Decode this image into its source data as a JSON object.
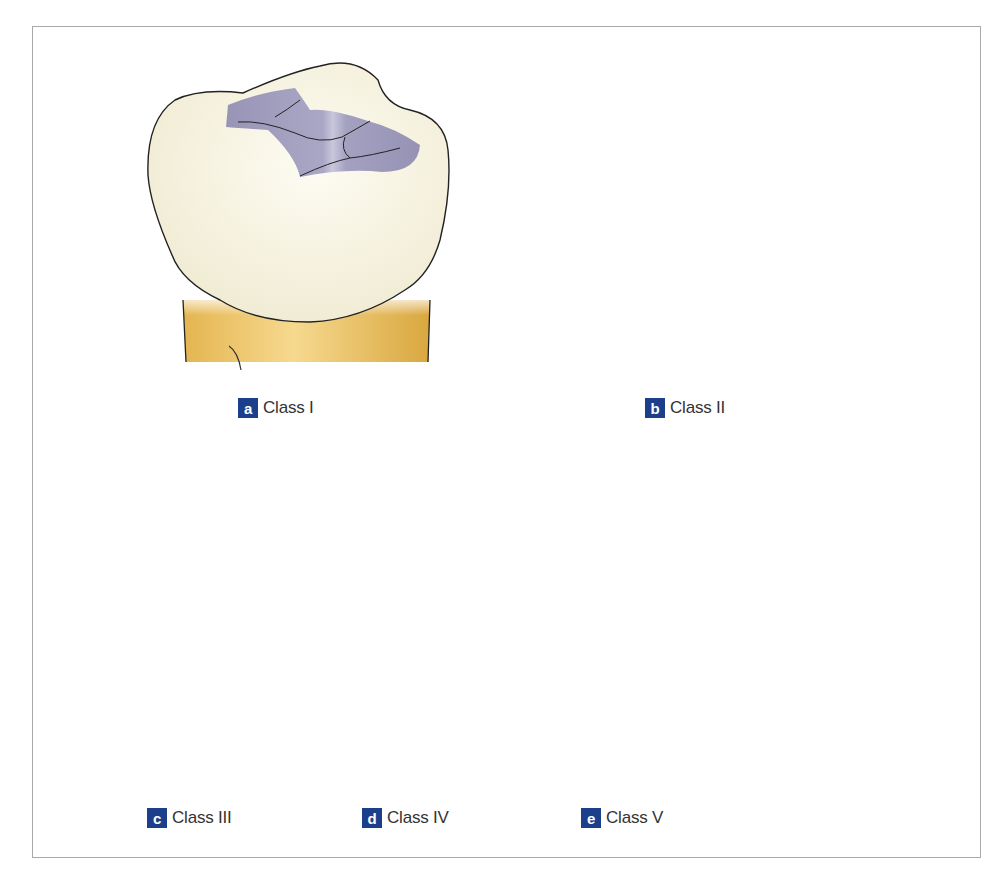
{
  "figure": {
    "panels": [
      {
        "id": "a",
        "letter": "a",
        "label": "Class I",
        "tooth": "molar",
        "lesion": "occlusal pits and fissures"
      },
      {
        "id": "b",
        "letter": "b",
        "label": "Class II",
        "tooth": "molar",
        "lesion": "occlusal plus proximal surface"
      },
      {
        "id": "c",
        "letter": "c",
        "label": "Class III",
        "tooth": "incisor",
        "lesion": "proximal surface, incisal edge intact"
      },
      {
        "id": "d",
        "letter": "d",
        "label": "Class IV",
        "tooth": "incisor",
        "lesion": "proximal surface including incisal angle"
      },
      {
        "id": "e",
        "letter": "e",
        "label": "Class V",
        "tooth": "incisor",
        "lesion": "cervical third"
      }
    ],
    "colors": {
      "enamel": "#f6f2df",
      "root": "#e8b95a",
      "lesion": "#9b98b8",
      "outline": "#222222",
      "badge": "#1b3f8a",
      "frame": "#a9a9a9"
    }
  }
}
